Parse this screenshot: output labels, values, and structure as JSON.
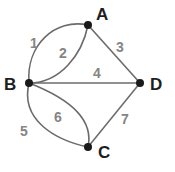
{
  "diagram": {
    "type": "graph",
    "nodes": [
      {
        "id": "A",
        "label": "A"
      },
      {
        "id": "B",
        "label": "B"
      },
      {
        "id": "C",
        "label": "C"
      },
      {
        "id": "D",
        "label": "D"
      }
    ],
    "edges": [
      {
        "label": "1",
        "from": "B",
        "to": "A"
      },
      {
        "label": "2",
        "from": "B",
        "to": "A"
      },
      {
        "label": "3",
        "from": "A",
        "to": "D"
      },
      {
        "label": "4",
        "from": "B",
        "to": "D"
      },
      {
        "label": "5",
        "from": "B",
        "to": "C"
      },
      {
        "label": "6",
        "from": "B",
        "to": "C"
      },
      {
        "label": "7",
        "from": "C",
        "to": "D"
      }
    ],
    "colors": {
      "edge": "#6b6b6b",
      "node": "#1a1a1a",
      "edge_label": "#858585",
      "node_label": "#1e1e1e"
    }
  }
}
